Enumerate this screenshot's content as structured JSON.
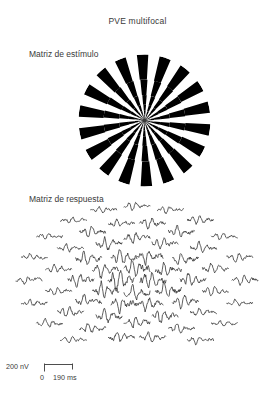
{
  "figure": {
    "title": "PVE multifocal",
    "stimulus_label": "Matriz de estímulo",
    "response_label": "Matriz de respuesta",
    "ink_color": "#2a2a2a",
    "background_color": "#ffffff"
  },
  "scalebar": {
    "amplitude_label": "200 nV",
    "time_start_label": "0",
    "time_end_label": "190 ms"
  },
  "chart_data": {
    "type": "line",
    "title": "PVE multifocal",
    "xlabel": "0 190 ms",
    "ylabel": "200 nV",
    "x": [
      0,
      190
    ],
    "xlim": [
      0,
      190
    ],
    "ylim": [
      -200,
      200
    ],
    "grid": false,
    "legend": null,
    "annotations": [
      "Matriz de estímulo",
      "Matriz de respuesta"
    ],
    "stimulus": {
      "kind": "dartboard-checkerboard",
      "shape": "circle",
      "rings": 9,
      "sectors": 36,
      "scaling": "cortical-magnification",
      "colors": [
        "#000000",
        "#ffffff"
      ],
      "center_x": 144,
      "center_y": 120,
      "radius": 66
    },
    "response_matrix": {
      "kind": "multifocal-VEP-trace-array",
      "arrangement": "radial-dartboard",
      "center_x": 137,
      "center_y": 280,
      "rings": 5,
      "traces_total": 60,
      "ring_counts": [
        4,
        8,
        12,
        16,
        20
      ],
      "ring_radii_x": [
        16,
        34,
        56,
        80,
        108
      ],
      "ring_radii_y": [
        12,
        26,
        42,
        58,
        74
      ],
      "trace_width": 26,
      "trace_height": 17,
      "amplitude_by_ring": [
        1.0,
        0.85,
        0.7,
        0.55,
        0.45
      ],
      "series": [
        {
          "name": "ring-1",
          "values": [
            0,
            2,
            -6,
            22,
            -30,
            14,
            -4,
            6,
            -2,
            3,
            -1,
            2,
            0
          ]
        },
        {
          "name": "ring-2",
          "values": [
            0,
            3,
            -8,
            19,
            -26,
            11,
            -3,
            5,
            -2,
            2,
            -1,
            1,
            0
          ]
        },
        {
          "name": "ring-3",
          "values": [
            0,
            -2,
            7,
            -16,
            20,
            -9,
            4,
            -5,
            2,
            -2,
            1,
            -1,
            0
          ]
        },
        {
          "name": "ring-4",
          "values": [
            0,
            2,
            -5,
            12,
            -15,
            8,
            -3,
            4,
            -2,
            2,
            -1,
            1,
            0
          ]
        },
        {
          "name": "ring-5",
          "values": [
            0,
            -1,
            4,
            -9,
            11,
            -6,
            3,
            -3,
            1,
            -1,
            1,
            0,
            0
          ]
        }
      ]
    }
  }
}
